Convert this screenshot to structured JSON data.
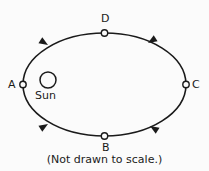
{
  "figure": {
    "caption": "(Not drawn to scale.)",
    "background_color": "#fbfbfb",
    "stroke_color": "#1a1a1a",
    "label_color": "#1a1a1a"
  },
  "sun": {
    "label": "Sun",
    "center_x": 48,
    "center_y": 80,
    "radius": 8
  },
  "orbit": {
    "center_x": 104.5,
    "center_y": 84.5,
    "radius_x": 81.5,
    "radius_y": 51.5,
    "stroke_width": 1.6,
    "direction": "A to B to C to D"
  },
  "points": [
    {
      "id": "A",
      "label": "A",
      "x": 23,
      "y": 84.5,
      "marker_radius": 3.2
    },
    {
      "id": "B",
      "label": "B",
      "x": 104.5,
      "y": 136,
      "marker_radius": 3.2
    },
    {
      "id": "C",
      "label": "C",
      "x": 186,
      "y": 84.5,
      "marker_radius": 3.2
    },
    {
      "id": "D",
      "label": "D",
      "x": 104.5,
      "y": 33,
      "marker_radius": 3.2
    }
  ],
  "arrows": [
    {
      "id": "upper-left",
      "x": 48,
      "y": 45,
      "rotation": 212,
      "direction": "toward A"
    },
    {
      "id": "upper-right",
      "x": 148,
      "y": 43,
      "rotation": 328,
      "direction": "toward D"
    },
    {
      "id": "lower-left",
      "x": 48,
      "y": 124,
      "rotation": 148,
      "direction": "toward B"
    },
    {
      "id": "lower-right",
      "x": 150,
      "y": 126,
      "rotation": 32,
      "direction": "toward B"
    }
  ]
}
